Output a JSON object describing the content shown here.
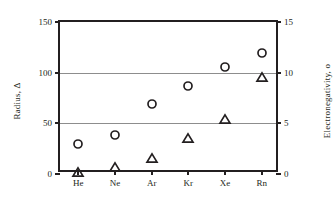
{
  "chart_data": {
    "type": "scatter",
    "title": "",
    "xlabel": "",
    "categories": [
      "He",
      "Ne",
      "Ar",
      "Kr",
      "Xe",
      "Rn"
    ],
    "grid": true,
    "legend": "none",
    "axes": {
      "left": {
        "label": "Radius, Δ",
        "ticks": [
          0,
          50,
          100,
          150
        ],
        "ticklabels": [
          "0",
          "50",
          "100",
          "150"
        ],
        "lim": [
          0,
          150
        ]
      },
      "right": {
        "label": "Electronegativity, o",
        "ticks": [
          0,
          5,
          10,
          15
        ],
        "ticklabels": [
          "0",
          "5",
          "10",
          "15"
        ],
        "lim": [
          0,
          15
        ]
      }
    },
    "series": [
      {
        "name": "Radius",
        "marker": "circle",
        "axis": "left",
        "values": [
          30,
          38,
          69,
          87,
          106,
          119
        ]
      },
      {
        "name": "Electronegativity",
        "marker": "triangle",
        "axis": "right",
        "values": [
          0.2,
          0.7,
          1.6,
          3.6,
          5.4,
          9.6
        ]
      }
    ]
  }
}
